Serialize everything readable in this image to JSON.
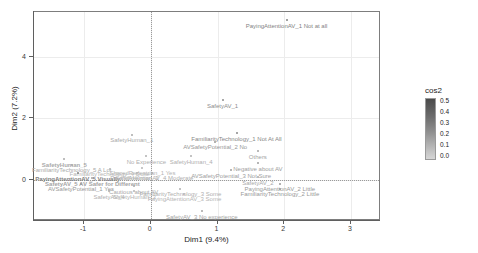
{
  "chart_data": {
    "type": "scatter",
    "title": "",
    "xlabel": "Dim1 (9.4%)",
    "ylabel": "Dim2 (7.2%)",
    "xlim": [
      -1.75,
      3.45
    ],
    "ylim": [
      -1.35,
      5.45
    ],
    "xticks": [
      "-1",
      "0",
      "1",
      "2",
      "3"
    ],
    "yticks": [
      "0",
      "2",
      "4"
    ],
    "grid": true,
    "legend": {
      "title": "cos2",
      "position": "right",
      "ticks": [
        "0.5",
        "0.4",
        "0.3",
        "0.2",
        "0.1",
        "0.0"
      ],
      "colormap_high": "#4a4a4a",
      "colormap_low": "#d6d6d6"
    },
    "points": [
      {
        "label": "PayingAttentionAV_1 Not at all",
        "x": 2.05,
        "y": 5.15,
        "cos2": 0.3,
        "bold": false
      },
      {
        "label": "SafetyAV_1",
        "x": 1.09,
        "y": 2.55,
        "cos2": 0.26,
        "bold": false
      },
      {
        "label": "SafetyHuman_1",
        "x": -0.27,
        "y": 1.42,
        "cos2": 0.16,
        "bold": false
      },
      {
        "label": "FamiliarityTechnology_1 Not At All",
        "x": 1.3,
        "y": 1.47,
        "cos2": 0.28,
        "bold": false
      },
      {
        "label": "AVSafetyPotential_2 No",
        "x": 0.98,
        "y": 1.19,
        "cos2": 0.22,
        "bold": false
      },
      {
        "label": "Others",
        "x": 1.62,
        "y": 0.89,
        "cos2": 0.18,
        "bold": false
      },
      {
        "label": "No Experience",
        "x": -0.05,
        "y": 0.72,
        "cos2": 0.14,
        "bold": false
      },
      {
        "label": "SafetyHuman_4",
        "x": 0.62,
        "y": 0.72,
        "cos2": 0.14,
        "bold": false
      },
      {
        "label": "Negative about AV",
        "x": 1.62,
        "y": 0.5,
        "cos2": 0.2,
        "bold": false
      },
      {
        "label": "SafetyHuman_5",
        "x": -1.28,
        "y": 0.62,
        "cos2": 0.16,
        "bold": true
      },
      {
        "label": "FamiliarityTechnology_5 A Lot",
        "x": -1.17,
        "y": 0.44,
        "cos2": 0.16,
        "bold": false
      },
      {
        "label": "FamiliarityTechnology_4 Quite",
        "x": -0.6,
        "y": 0.32,
        "cos2": 0.12,
        "bold": false
      },
      {
        "label": "SharedPedestrian_1 Yes",
        "x": -0.11,
        "y": 0.35,
        "cos2": 0.12,
        "bold": false
      },
      {
        "label": "AVSafetyPotential_3 Not Sure",
        "x": 1.22,
        "y": 0.27,
        "cos2": 0.2,
        "bold": false
      },
      {
        "label": "PayingAttentionAV_5 Visually",
        "x": -1.08,
        "y": 0.17,
        "cos2": 0.3,
        "bold": true
      },
      {
        "label": "SafetyHuman_2",
        "x": -0.19,
        "y": 0.18,
        "cos2": 0.12,
        "bold": false
      },
      {
        "label": "PayingAttentionAV_4 Moderate",
        "x": 0.03,
        "y": 0.18,
        "cos2": 0.14,
        "bold": false
      },
      {
        "label": "SafetyAV_5 AV Safer for Different",
        "x": -0.86,
        "y": 0.01,
        "cos2": 0.18,
        "bold": true
      },
      {
        "label": "SafetyAV_2",
        "x": 1.62,
        "y": 0.04,
        "cos2": 0.16,
        "bold": false
      },
      {
        "label": "AVSafetyPotential_1 Yes",
        "x": -1.03,
        "y": -0.17,
        "cos2": 0.22,
        "bold": false
      },
      {
        "label": "Cautious about AV",
        "x": -0.24,
        "y": -0.25,
        "cos2": 0.16,
        "bold": false
      },
      {
        "label": "PayingAttentionAV_2 Little",
        "x": 1.95,
        "y": -0.17,
        "cos2": 0.22,
        "bold": false
      },
      {
        "label": "SafetyAV_4",
        "x": -0.61,
        "y": -0.42,
        "cos2": 0.14,
        "bold": false
      },
      {
        "label": "SafetyHuman_3",
        "x": -0.23,
        "y": -0.42,
        "cos2": 0.12,
        "bold": false
      },
      {
        "label": "FamiliarityTechnology_3 Some",
        "x": 0.46,
        "y": -0.33,
        "cos2": 0.14,
        "bold": false
      },
      {
        "label": "FamiliarityTechnology_2 Little",
        "x": 1.95,
        "y": -0.33,
        "cos2": 0.22,
        "bold": false
      },
      {
        "label": "PayingAttentionAV_3 Some",
        "x": 0.52,
        "y": -0.5,
        "cos2": 0.12,
        "bold": false
      },
      {
        "label": "SafetyAV_3 No experience",
        "x": 0.78,
        "y": -1.06,
        "cos2": 0.18,
        "bold": false
      }
    ]
  }
}
